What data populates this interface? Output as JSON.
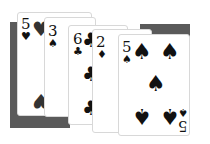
{
  "table": {
    "backing_color": "#5a5a5a"
  },
  "hand": [
    {
      "rank": "5",
      "suit": "♥",
      "suit_name": "hearts",
      "pip": "♥"
    },
    {
      "rank": "3",
      "suit": "♠",
      "suit_name": "spades",
      "pip": "♠"
    },
    {
      "rank": "6",
      "suit": "♣",
      "suit_name": "clubs",
      "pip": "♣"
    },
    {
      "rank": "2",
      "suit": "♦",
      "suit_name": "diamonds",
      "pip": "♦"
    },
    {
      "rank": "5",
      "suit": "♠",
      "suit_name": "spades",
      "pip": "♠",
      "corner_rank_bottom": "5"
    }
  ]
}
